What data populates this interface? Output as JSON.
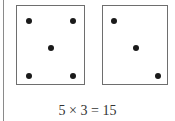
{
  "equation": "5 × 3 = 15",
  "cards": [
    {
      "label": "card-five",
      "count": 5,
      "dots": [
        [
          12,
          15
        ],
        [
          56,
          15
        ],
        [
          34,
          42
        ],
        [
          12,
          70
        ],
        [
          56,
          70
        ]
      ]
    },
    {
      "label": "card-three",
      "count": 3,
      "dots": [
        [
          12,
          15
        ],
        [
          34,
          42
        ],
        [
          66,
          70
        ]
      ]
    }
  ],
  "colors": {
    "dot": "#1a1a1a",
    "border": "#6e6e6e"
  }
}
